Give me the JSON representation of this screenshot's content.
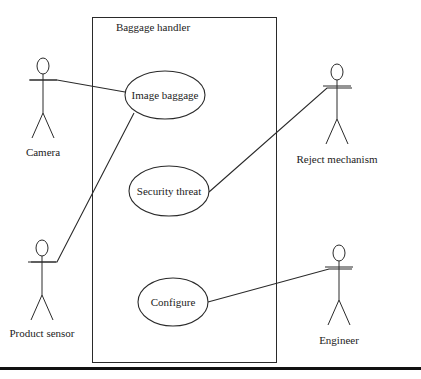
{
  "diagram": {
    "type": "uml-use-case",
    "system": {
      "name": "Baggage handler",
      "box": {
        "x": 92,
        "y": 17,
        "w": 184,
        "h": 345
      }
    },
    "use_cases": [
      {
        "id": "image",
        "label": "Image baggage",
        "cx": 165,
        "cy": 95,
        "rx": 40,
        "ry": 24
      },
      {
        "id": "security",
        "label": "Security threat",
        "cx": 169,
        "cy": 191,
        "rx": 40,
        "ry": 25
      },
      {
        "id": "configure",
        "label": "Configure",
        "cx": 173,
        "cy": 302,
        "rx": 35,
        "ry": 24
      }
    ],
    "actors": [
      {
        "id": "camera",
        "label": "Camera",
        "x": 43,
        "headY": 66,
        "labelY": 147
      },
      {
        "id": "product-sensor",
        "label": "Product sensor",
        "x": 42,
        "headY": 248,
        "labelY": 328
      },
      {
        "id": "reject",
        "label": "Reject mechanism",
        "x": 337,
        "headY": 72,
        "labelY": 154
      },
      {
        "id": "engineer",
        "label": "Engineer",
        "x": 339,
        "headY": 253,
        "labelY": 335
      }
    ],
    "associations": [
      {
        "from": "camera",
        "to": "image",
        "points": [
          [
            30,
            80
          ],
          [
            57,
            80
          ],
          [
            125,
            92
          ]
        ]
      },
      {
        "from": "product-sensor",
        "to": "image",
        "points": [
          [
            31,
            262
          ],
          [
            57,
            262
          ],
          [
            134,
            113
          ]
        ]
      },
      {
        "from": "reject",
        "to": "security",
        "points": [
          [
            352,
            88
          ],
          [
            327,
            88
          ],
          [
            209,
            192
          ]
        ]
      },
      {
        "from": "engineer",
        "to": "configure",
        "points": [
          [
            352,
            269
          ],
          [
            329,
            269
          ],
          [
            208,
            302
          ]
        ]
      }
    ],
    "colors": {
      "line": "#2a2a2a",
      "text": "#222222",
      "background": "#ffffff",
      "rule": "#111111"
    }
  }
}
